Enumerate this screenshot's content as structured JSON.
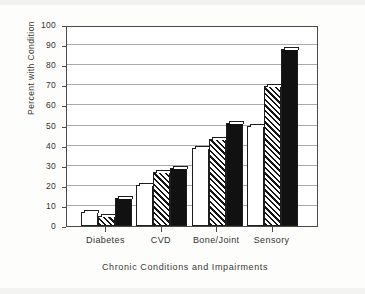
{
  "chart_data": {
    "type": "bar",
    "title": "",
    "xlabel": "Chronic Conditions and Impairments",
    "ylabel": "Percent with Condition",
    "categories": [
      "Diabetes",
      "CVD",
      "Bone/Joint",
      "Sensory"
    ],
    "series": [
      {
        "name": "series-1",
        "pattern": "white",
        "values": [
          7,
          20.5,
          39,
          50
        ]
      },
      {
        "name": "series-2",
        "pattern": "hatched",
        "values": [
          5,
          27,
          43.5,
          69.5
        ]
      },
      {
        "name": "series-3",
        "pattern": "black",
        "values": [
          14,
          29,
          51.5,
          88
        ]
      }
    ],
    "ylim": [
      0,
      100
    ],
    "yticks": [
      0,
      10,
      20,
      30,
      40,
      50,
      60,
      70,
      80,
      90,
      100
    ],
    "ytick_labels": [
      "0",
      "10",
      "20",
      "30",
      "40",
      "50",
      "60",
      "70",
      "80",
      "90",
      "100"
    ],
    "grid": true,
    "legend": "none",
    "legend_position": "none",
    "colors": {
      "bar_white": "#ffffff",
      "bar_black": "#111111",
      "hatch_line": "#141414",
      "axis": "#4a4a4a",
      "gridline": "#8d8d8d",
      "background": "#ffffff",
      "page": "#fdfdfc",
      "text": "#333333"
    }
  }
}
